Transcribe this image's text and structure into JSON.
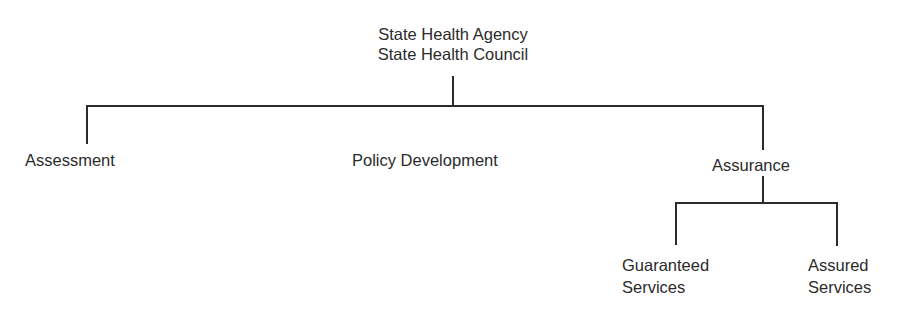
{
  "diagram": {
    "type": "org-chart",
    "root": {
      "lines": [
        "State Health Agency",
        "State Health Council"
      ]
    },
    "branches": [
      {
        "label": "Assessment"
      },
      {
        "label": "Policy Development"
      },
      {
        "label": "Assurance"
      }
    ],
    "assurance_children": [
      {
        "lines": [
          "Guaranteed",
          "Services"
        ]
      },
      {
        "lines": [
          "Assured",
          "Services"
        ]
      }
    ],
    "colors": {
      "line": "#2b2b2b",
      "text": "#2b2b2b",
      "background": "#ffffff"
    }
  }
}
